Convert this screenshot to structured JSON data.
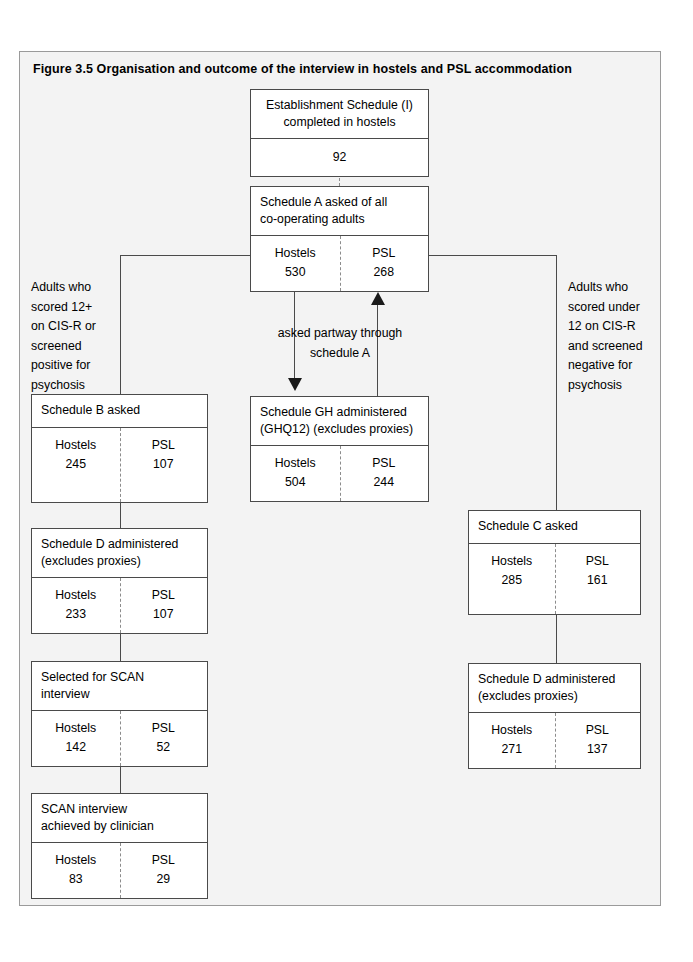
{
  "figure": {
    "title": "Figure 3.5  Organisation and outcome of the interview in hostels and PSL accommodation"
  },
  "labels": {
    "hostels": "Hostels",
    "psl": "PSL"
  },
  "nodes": {
    "establishment": {
      "head_line1": "Establishment  Schedule (I)",
      "head_line2": "completed in hostels",
      "value": "92"
    },
    "schedule_a": {
      "head_line1": "Schedule A  asked of all",
      "head_line2": "co-operating adults",
      "hostels_label": "Hostels",
      "hostels_value": "530",
      "psl_label": "PSL",
      "psl_value": "268"
    },
    "schedule_gh": {
      "head_line1": "Schedule GH administered",
      "head_line2": "(GHQ12) (excludes proxies)",
      "hostels_label": "Hostels",
      "hostels_value": "504",
      "psl_label": "PSL",
      "psl_value": "244"
    },
    "schedule_b": {
      "head_line1": "Schedule B asked",
      "hostels_label": "Hostels",
      "hostels_value": "245",
      "psl_label": "PSL",
      "psl_value": "107"
    },
    "schedule_d_left": {
      "head_line1": "Schedule D administered",
      "head_line2": "(excludes proxies)",
      "hostels_label": "Hostels",
      "hostels_value": "233",
      "psl_label": "PSL",
      "psl_value": "107"
    },
    "scan_selected": {
      "head_line1": "Selected for SCAN",
      "head_line2": "interview",
      "hostels_label": "Hostels",
      "hostels_value": "142",
      "psl_label": "PSL",
      "psl_value": "52"
    },
    "scan_achieved": {
      "head_line1": "SCAN interview",
      "head_line2": "achieved by clinician",
      "hostels_label": "Hostels",
      "hostels_value": "83",
      "psl_label": "PSL",
      "psl_value": "29"
    },
    "schedule_c": {
      "head_line1": "Schedule C asked",
      "hostels_label": "Hostels",
      "hostels_value": "285",
      "psl_label": "PSL",
      "psl_value": "161"
    },
    "schedule_d_right": {
      "head_line1": "Schedule D administered",
      "head_line2": "(excludes proxies)",
      "hostels_label": "Hostels",
      "hostels_value": "271",
      "psl_label": "PSL",
      "psl_value": "137"
    }
  },
  "annotations": {
    "left_branch": {
      "line1": "Adults who",
      "line2": "scored 12+",
      "line3": "on CIS-R or",
      "line4": "screened",
      "line5": "positive for",
      "line6": "psychosis"
    },
    "right_branch": {
      "line1": "Adults who",
      "line2": "scored under",
      "line3": "12 on CIS-R",
      "line4": "and screened",
      "line5": "negative for",
      "line6": "psychosis"
    },
    "middle": {
      "line1": "asked partway through",
      "line2": "schedule A"
    }
  },
  "colors": {
    "border": "#4a4a4a",
    "divider": "#8c8c8c",
    "arrow": "#1a1a1a",
    "page_background": "#f3f3f3",
    "box_background": "#ffffff"
  }
}
